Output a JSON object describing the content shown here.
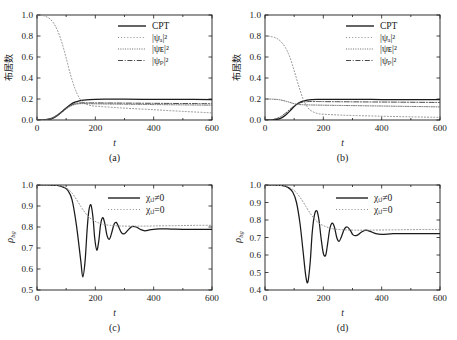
{
  "figure": {
    "background": "#ffffff",
    "line_color": "#1a1a1a",
    "panel_count": 4
  },
  "axis_labels": {
    "x": "t",
    "y_population": "布居数",
    "y_rho": "ρ",
    "y_rho_sub": "bg"
  },
  "captions": {
    "a": "(a)",
    "b": "(b)",
    "c": "(c)",
    "d": "(d)"
  },
  "legend_population": [
    {
      "label": "CPT",
      "style": "solid"
    },
    {
      "label": "|ψₐ|²",
      "style": "dotted"
    },
    {
      "label": "|ψᴇ|²",
      "style": "densely-dotted"
    },
    {
      "label": "|ψₚ|²",
      "style": "dashdot"
    }
  ],
  "legend_rho": [
    {
      "label": "χᵢⱼ≠0",
      "style": "solid"
    },
    {
      "label": "χᵢⱼ=0",
      "style": "dotted"
    }
  ],
  "x_ticks": [
    "0",
    "200",
    "400",
    "600"
  ],
  "y_ticks_population": [
    "0.0",
    "0.2",
    "0.4",
    "0.6",
    "0.8",
    "1.0"
  ],
  "y_ticks_c": [
    "0.5",
    "0.6",
    "0.7",
    "0.8",
    "0.9",
    "1.0"
  ],
  "y_ticks_d": [
    "0.4",
    "0.5",
    "0.6",
    "0.7",
    "0.8",
    "0.9",
    "1.0"
  ],
  "chart_data": [
    {
      "type": "line",
      "panel": "a",
      "title": "",
      "xlabel": "t",
      "ylabel": "布居数",
      "xlim": [
        0,
        600
      ],
      "ylim": [
        0.0,
        1.0
      ],
      "grid": false,
      "legend_position": "upper-right",
      "series": [
        {
          "name": "CPT",
          "style": "solid",
          "x": [
            0,
            20,
            40,
            55,
            70,
            85,
            100,
            115,
            130,
            145,
            160,
            180,
            200,
            250,
            300,
            400,
            500,
            600
          ],
          "y": [
            0.0,
            0.0,
            0.005,
            0.018,
            0.042,
            0.078,
            0.115,
            0.148,
            0.17,
            0.183,
            0.19,
            0.195,
            0.197,
            0.198,
            0.198,
            0.197,
            0.196,
            0.195
          ]
        },
        {
          "name": "|ψa|²",
          "style": "dotted",
          "x": [
            0,
            20,
            40,
            55,
            70,
            85,
            100,
            115,
            130,
            145,
            160,
            180,
            200,
            250,
            300,
            400,
            500,
            600
          ],
          "y": [
            1.0,
            0.995,
            0.972,
            0.93,
            0.855,
            0.74,
            0.59,
            0.43,
            0.3,
            0.21,
            0.165,
            0.14,
            0.132,
            0.122,
            0.113,
            0.098,
            0.082,
            0.068
          ]
        },
        {
          "name": "|ψE|²",
          "style": "densely-dotted",
          "x": [
            0,
            20,
            40,
            55,
            70,
            85,
            100,
            115,
            130,
            145,
            160,
            180,
            200,
            250,
            300,
            400,
            500,
            600
          ],
          "y": [
            0.0,
            0.002,
            0.008,
            0.02,
            0.042,
            0.072,
            0.105,
            0.132,
            0.148,
            0.155,
            0.156,
            0.155,
            0.154,
            0.152,
            0.15,
            0.147,
            0.144,
            0.141
          ]
        },
        {
          "name": "|ψp|²",
          "style": "dashdot",
          "x": [
            0,
            20,
            40,
            55,
            70,
            85,
            100,
            115,
            130,
            145,
            160,
            180,
            200,
            250,
            300,
            400,
            500,
            600
          ],
          "y": [
            0.0,
            0.002,
            0.01,
            0.025,
            0.05,
            0.082,
            0.115,
            0.14,
            0.155,
            0.162,
            0.164,
            0.164,
            0.163,
            0.162,
            0.161,
            0.159,
            0.157,
            0.155
          ]
        }
      ]
    },
    {
      "type": "line",
      "panel": "b",
      "title": "",
      "xlabel": "t",
      "ylabel": "布居数",
      "xlim": [
        0,
        600
      ],
      "ylim": [
        0.0,
        1.0
      ],
      "grid": false,
      "legend_position": "upper-right",
      "series": [
        {
          "name": "CPT",
          "style": "solid",
          "x": [
            0,
            20,
            40,
            55,
            70,
            85,
            100,
            115,
            130,
            145,
            160,
            180,
            200,
            250,
            300,
            400,
            500,
            600
          ],
          "y": [
            0.0,
            0.0,
            0.005,
            0.018,
            0.045,
            0.085,
            0.128,
            0.162,
            0.18,
            0.19,
            0.194,
            0.196,
            0.197,
            0.197,
            0.196,
            0.195,
            0.194,
            0.193
          ]
        },
        {
          "name": "|ψa|²",
          "style": "dotted",
          "x": [
            0,
            20,
            40,
            55,
            70,
            85,
            100,
            115,
            130,
            145,
            160,
            180,
            200,
            250,
            300,
            400,
            500,
            600
          ],
          "y": [
            0.8,
            0.795,
            0.778,
            0.745,
            0.69,
            0.6,
            0.47,
            0.33,
            0.205,
            0.125,
            0.085,
            0.062,
            0.055,
            0.048,
            0.043,
            0.036,
            0.03,
            0.025
          ]
        },
        {
          "name": "|ψE|²",
          "style": "densely-dotted",
          "x": [
            0,
            20,
            40,
            55,
            70,
            85,
            100,
            115,
            130,
            145,
            160,
            180,
            200,
            250,
            300,
            400,
            500,
            600
          ],
          "y": [
            0.2,
            0.199,
            0.196,
            0.19,
            0.18,
            0.168,
            0.155,
            0.148,
            0.145,
            0.144,
            0.143,
            0.142,
            0.141,
            0.139,
            0.137,
            0.133,
            0.129,
            0.125
          ]
        },
        {
          "name": "|ψp|²",
          "style": "dashdot",
          "x": [
            0,
            20,
            40,
            55,
            70,
            85,
            100,
            115,
            130,
            145,
            160,
            180,
            200,
            250,
            300,
            400,
            500,
            600
          ],
          "y": [
            0.0,
            0.003,
            0.014,
            0.034,
            0.064,
            0.1,
            0.135,
            0.158,
            0.17,
            0.175,
            0.176,
            0.176,
            0.175,
            0.174,
            0.173,
            0.171,
            0.169,
            0.167
          ]
        }
      ]
    },
    {
      "type": "line",
      "panel": "c",
      "title": "",
      "xlabel": "t",
      "ylabel": "ρbg",
      "xlim": [
        0,
        600
      ],
      "ylim": [
        0.5,
        1.0
      ],
      "grid": false,
      "legend_position": "upper-right",
      "series": [
        {
          "name": "χij≠0",
          "style": "solid",
          "x": [
            0,
            40,
            70,
            90,
            105,
            120,
            135,
            150,
            157,
            165,
            172,
            178,
            185,
            192,
            198,
            205,
            212,
            218,
            225,
            232,
            240,
            248,
            256,
            264,
            272,
            280,
            290,
            300,
            312,
            325,
            340,
            355,
            370,
            390,
            420,
            460,
            500,
            550,
            600
          ],
          "y": [
            1.0,
            1.0,
            0.998,
            0.99,
            0.975,
            0.93,
            0.81,
            0.64,
            0.562,
            0.64,
            0.79,
            0.88,
            0.905,
            0.845,
            0.745,
            0.69,
            0.735,
            0.812,
            0.845,
            0.82,
            0.76,
            0.742,
            0.772,
            0.812,
            0.822,
            0.8,
            0.772,
            0.768,
            0.785,
            0.802,
            0.8,
            0.788,
            0.782,
            0.787,
            0.791,
            0.79,
            0.789,
            0.789,
            0.789
          ]
        },
        {
          "name": "χij=0",
          "style": "dotted",
          "x": [
            0,
            40,
            70,
            90,
            105,
            120,
            135,
            150,
            165,
            180,
            195,
            210,
            230,
            250,
            280,
            320,
            360,
            400,
            450,
            500,
            550,
            600
          ],
          "y": [
            1.0,
            1.0,
            0.998,
            0.992,
            0.982,
            0.962,
            0.932,
            0.898,
            0.868,
            0.845,
            0.83,
            0.82,
            0.812,
            0.808,
            0.805,
            0.804,
            0.804,
            0.805,
            0.806,
            0.807,
            0.808,
            0.808
          ]
        }
      ]
    },
    {
      "type": "line",
      "panel": "d",
      "title": "",
      "xlabel": "t",
      "ylabel": "ρbg",
      "xlim": [
        0,
        600
      ],
      "ylim": [
        0.4,
        1.0
      ],
      "grid": false,
      "legend_position": "upper-right",
      "series": [
        {
          "name": "χij≠0",
          "style": "solid",
          "x": [
            0,
            30,
            60,
            80,
            95,
            108,
            120,
            130,
            140,
            147,
            155,
            162,
            170,
            178,
            185,
            192,
            200,
            208,
            215,
            222,
            230,
            238,
            246,
            254,
            262,
            272,
            282,
            292,
            302,
            315,
            330,
            345,
            360,
            380,
            400,
            440,
            480,
            530,
            600
          ],
          "y": [
            1.0,
            1.0,
            0.996,
            0.985,
            0.96,
            0.9,
            0.78,
            0.63,
            0.478,
            0.445,
            0.56,
            0.73,
            0.832,
            0.852,
            0.8,
            0.7,
            0.61,
            0.598,
            0.668,
            0.748,
            0.782,
            0.76,
            0.7,
            0.678,
            0.705,
            0.748,
            0.76,
            0.742,
            0.715,
            0.712,
            0.73,
            0.742,
            0.735,
            0.722,
            0.718,
            0.722,
            0.722,
            0.722,
            0.722
          ]
        },
        {
          "name": "χij=0",
          "style": "dotted",
          "x": [
            0,
            30,
            60,
            80,
            95,
            110,
            125,
            140,
            155,
            170,
            185,
            200,
            220,
            240,
            270,
            310,
            350,
            400,
            450,
            500,
            550,
            600
          ],
          "y": [
            1.0,
            1.0,
            0.996,
            0.988,
            0.975,
            0.952,
            0.918,
            0.878,
            0.838,
            0.805,
            0.782,
            0.768,
            0.755,
            0.748,
            0.744,
            0.742,
            0.742,
            0.743,
            0.744,
            0.745,
            0.746,
            0.746
          ]
        }
      ]
    }
  ]
}
